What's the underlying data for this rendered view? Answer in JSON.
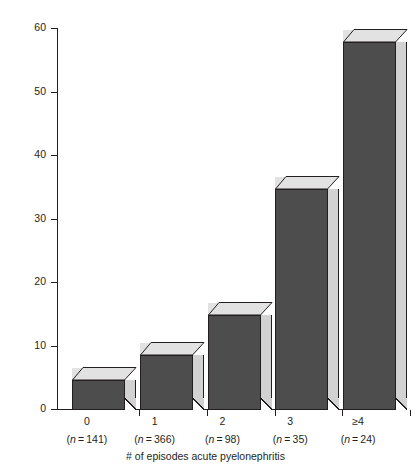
{
  "chart_data": {
    "type": "bar",
    "title": "",
    "subtitle": "",
    "xlabel": "# of episodes acute pyelonephritis",
    "ylabel": "% with renal scaring",
    "categories": [
      "0",
      "1",
      "2",
      "3",
      "≥4"
    ],
    "group_sizes": [
      141,
      366,
      98,
      35,
      24
    ],
    "group_size_labels": [
      "(n = 141)",
      "(n = 366)",
      "(n = 98)",
      "(n = 35)",
      "(n = 24)"
    ],
    "values": [
      4.8,
      8.7,
      14.9,
      34.8,
      58.0
    ],
    "ylim": [
      0,
      60
    ],
    "yticks": [
      0,
      10,
      20,
      30,
      40,
      50,
      60
    ],
    "ytick_labels": [
      "0",
      "10",
      "20",
      "30",
      "40",
      "50",
      "60"
    ],
    "grid": false,
    "legend": null,
    "style": "3d-bars",
    "colors": {
      "bar_front": "#4d4d4d",
      "bar_top": "#e2e2e2",
      "bar_side": "#d2d2d2",
      "outline": "#231f20",
      "background": "#ffffff",
      "text": "#231f20"
    }
  }
}
